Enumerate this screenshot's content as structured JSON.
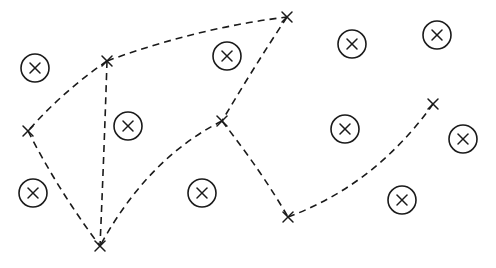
{
  "diagram": {
    "background": "#ffffff",
    "ink_color": "#1a1a1a",
    "nodes": [
      {
        "id": "A",
        "x": 107,
        "y": 61
      },
      {
        "id": "B",
        "x": 287,
        "y": 17
      },
      {
        "id": "C",
        "x": 28,
        "y": 131
      },
      {
        "id": "D",
        "x": 222,
        "y": 121
      },
      {
        "id": "E",
        "x": 100,
        "y": 246
      },
      {
        "id": "F",
        "x": 288,
        "y": 217
      },
      {
        "id": "G",
        "x": 433,
        "y": 104
      }
    ],
    "edges": [
      {
        "from": "A",
        "to": "B",
        "style": "dashed",
        "curve": [
          197,
          28
        ]
      },
      {
        "from": "A",
        "to": "C",
        "style": "dashed",
        "curve": [
          62,
          92
        ]
      },
      {
        "from": "A",
        "to": "E",
        "style": "dashed",
        "curve": [
          104,
          155
        ]
      },
      {
        "from": "C",
        "to": "E",
        "style": "dashed",
        "curve": [
          58,
          190
        ]
      },
      {
        "from": "B",
        "to": "D",
        "style": "dashed",
        "curve": [
          252,
          70
        ]
      },
      {
        "from": "D",
        "to": "E",
        "style": "dashed",
        "curve": [
          148,
          158
        ]
      },
      {
        "from": "D",
        "to": "F",
        "style": "dashed",
        "curve": [
          262,
          172
        ]
      },
      {
        "from": "F",
        "to": "G",
        "style": "dashed",
        "curve": [
          375,
          185
        ]
      }
    ],
    "markers": [
      {
        "symbol": "circled-x",
        "x": 35,
        "y": 68
      },
      {
        "symbol": "circled-x",
        "x": 227,
        "y": 56
      },
      {
        "symbol": "circled-x",
        "x": 128,
        "y": 126
      },
      {
        "symbol": "circled-x",
        "x": 352,
        "y": 44
      },
      {
        "symbol": "circled-x",
        "x": 437,
        "y": 35
      },
      {
        "symbol": "circled-x",
        "x": 345,
        "y": 129
      },
      {
        "symbol": "circled-x",
        "x": 463,
        "y": 139
      },
      {
        "symbol": "circled-x",
        "x": 33,
        "y": 193
      },
      {
        "symbol": "circled-x",
        "x": 202,
        "y": 193
      },
      {
        "symbol": "circled-x",
        "x": 402,
        "y": 200
      }
    ]
  }
}
